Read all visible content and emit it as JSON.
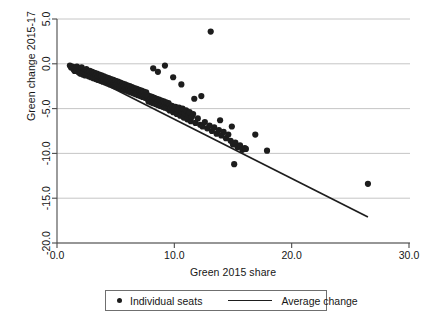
{
  "chart": {
    "type": "scatter",
    "title": "",
    "xlabel": "Green 2015 share",
    "ylabel": "Green change 2015-17",
    "xticks": [
      "0.0",
      "10.0",
      "20.0",
      "30.0"
    ],
    "yticks": [
      "5.0",
      "0.0",
      "-5.0",
      "-10.0",
      "-15.0",
      "-20.0"
    ],
    "legend": {
      "points_label": "Individual seats",
      "line_label": "Average change",
      "point_marker": "filled-circle-marker",
      "line_marker": "solid-line-marker"
    }
  },
  "chart_data": {
    "type": "scatter",
    "title": "",
    "xlabel": "Green 2015 share",
    "ylabel": "Green change 2015-17",
    "xlim": [
      0.0,
      30.0
    ],
    "ylim": [
      -20.0,
      5.0
    ],
    "xticks": [
      0.0,
      10.0,
      20.0,
      30.0
    ],
    "yticks": [
      5.0,
      0.0,
      -5.0,
      -10.0,
      -15.0,
      -20.0
    ],
    "grid": "horizontal",
    "legend_position": "below-axes",
    "series": [
      {
        "name": "Individual seats",
        "type": "scatter",
        "color": "#1d1d1d",
        "marker_size": 3.1,
        "points": [
          [
            1.1,
            -0.2
          ],
          [
            1.2,
            -0.4
          ],
          [
            1.3,
            -0.3
          ],
          [
            1.4,
            -0.6
          ],
          [
            1.5,
            -0.4
          ],
          [
            1.5,
            -0.8
          ],
          [
            1.6,
            -0.5
          ],
          [
            1.7,
            -0.7
          ],
          [
            1.7,
            -0.3
          ],
          [
            1.8,
            -0.9
          ],
          [
            1.8,
            -0.5
          ],
          [
            1.9,
            -0.6
          ],
          [
            1.9,
            -1.0
          ],
          [
            2.0,
            -0.7
          ],
          [
            2.0,
            -1.1
          ],
          [
            2.1,
            -0.8
          ],
          [
            2.1,
            -0.4
          ],
          [
            2.2,
            -0.9
          ],
          [
            2.2,
            -1.2
          ],
          [
            2.3,
            -0.7
          ],
          [
            2.3,
            -1.0
          ],
          [
            2.4,
            -1.3
          ],
          [
            2.4,
            -0.8
          ],
          [
            2.5,
            -1.1
          ],
          [
            2.5,
            -0.6
          ],
          [
            2.6,
            -1.2
          ],
          [
            2.6,
            -0.9
          ],
          [
            2.7,
            -1.4
          ],
          [
            2.7,
            -1.0
          ],
          [
            2.8,
            -1.2
          ],
          [
            2.8,
            -0.8
          ],
          [
            2.9,
            -1.5
          ],
          [
            2.9,
            -1.1
          ],
          [
            3.0,
            -1.3
          ],
          [
            3.0,
            -0.9
          ],
          [
            3.1,
            -1.6
          ],
          [
            3.1,
            -1.2
          ],
          [
            3.2,
            -1.4
          ],
          [
            3.2,
            -1.0
          ],
          [
            3.3,
            -1.7
          ],
          [
            3.3,
            -1.3
          ],
          [
            3.4,
            -1.5
          ],
          [
            3.4,
            -1.1
          ],
          [
            3.5,
            -1.8
          ],
          [
            3.5,
            -1.4
          ],
          [
            3.6,
            -1.6
          ],
          [
            3.6,
            -1.2
          ],
          [
            3.7,
            -1.9
          ],
          [
            3.7,
            -1.5
          ],
          [
            3.8,
            -1.7
          ],
          [
            3.8,
            -1.3
          ],
          [
            3.9,
            -2.0
          ],
          [
            3.9,
            -1.6
          ],
          [
            4.0,
            -1.8
          ],
          [
            4.0,
            -1.4
          ],
          [
            4.1,
            -2.1
          ],
          [
            4.1,
            -1.7
          ],
          [
            4.2,
            -1.9
          ],
          [
            4.2,
            -1.5
          ],
          [
            4.3,
            -2.2
          ],
          [
            4.3,
            -1.8
          ],
          [
            4.4,
            -2.0
          ],
          [
            4.4,
            -1.6
          ],
          [
            4.5,
            -2.3
          ],
          [
            4.5,
            -1.9
          ],
          [
            4.6,
            -2.1
          ],
          [
            4.6,
            -1.7
          ],
          [
            4.7,
            -2.4
          ],
          [
            4.7,
            -2.0
          ],
          [
            4.8,
            -2.2
          ],
          [
            4.8,
            -1.8
          ],
          [
            4.9,
            -2.5
          ],
          [
            4.9,
            -2.1
          ],
          [
            5.0,
            -2.3
          ],
          [
            5.0,
            -1.9
          ],
          [
            5.1,
            -2.6
          ],
          [
            5.1,
            -2.2
          ],
          [
            5.2,
            -2.4
          ],
          [
            5.2,
            -2.0
          ],
          [
            5.3,
            -2.7
          ],
          [
            5.3,
            -2.3
          ],
          [
            5.4,
            -2.5
          ],
          [
            5.4,
            -2.1
          ],
          [
            5.5,
            -2.8
          ],
          [
            5.5,
            -2.4
          ],
          [
            5.6,
            -2.6
          ],
          [
            5.6,
            -2.2
          ],
          [
            5.7,
            -2.9
          ],
          [
            5.7,
            -2.5
          ],
          [
            5.8,
            -2.7
          ],
          [
            5.8,
            -2.3
          ],
          [
            5.9,
            -3.0
          ],
          [
            5.9,
            -2.6
          ],
          [
            6.0,
            -2.8
          ],
          [
            6.0,
            -2.4
          ],
          [
            6.1,
            -3.1
          ],
          [
            6.1,
            -2.7
          ],
          [
            6.2,
            -2.9
          ],
          [
            6.2,
            -2.5
          ],
          [
            6.3,
            -3.2
          ],
          [
            6.3,
            -2.8
          ],
          [
            6.4,
            -3.0
          ],
          [
            6.4,
            -2.6
          ],
          [
            6.5,
            -3.3
          ],
          [
            6.5,
            -2.9
          ],
          [
            6.6,
            -3.1
          ],
          [
            6.6,
            -2.7
          ],
          [
            6.7,
            -3.4
          ],
          [
            6.7,
            -3.0
          ],
          [
            6.8,
            -3.2
          ],
          [
            6.8,
            -2.8
          ],
          [
            6.9,
            -3.5
          ],
          [
            6.9,
            -3.1
          ],
          [
            7.0,
            -3.3
          ],
          [
            7.0,
            -2.9
          ],
          [
            7.1,
            -3.6
          ],
          [
            7.1,
            -3.2
          ],
          [
            7.2,
            -3.4
          ],
          [
            7.2,
            -3.0
          ],
          [
            7.3,
            -3.7
          ],
          [
            7.3,
            -3.3
          ],
          [
            7.4,
            -3.5
          ],
          [
            7.4,
            -3.1
          ],
          [
            7.5,
            -3.8
          ],
          [
            7.5,
            -3.4
          ],
          [
            7.6,
            -3.6
          ],
          [
            7.6,
            -3.2
          ],
          [
            7.7,
            -3.9
          ],
          [
            7.7,
            -3.5
          ],
          [
            7.8,
            -3.7
          ],
          [
            7.8,
            -4.2
          ],
          [
            7.9,
            -4.0
          ],
          [
            7.9,
            -3.6
          ],
          [
            8.0,
            -3.8
          ],
          [
            8.0,
            -4.3
          ],
          [
            8.1,
            -4.1
          ],
          [
            8.1,
            -3.7
          ],
          [
            8.2,
            -3.9
          ],
          [
            8.2,
            -4.4
          ],
          [
            8.3,
            -4.2
          ],
          [
            8.3,
            -3.8
          ],
          [
            8.4,
            -4.0
          ],
          [
            8.4,
            -4.5
          ],
          [
            8.5,
            -4.3
          ],
          [
            8.5,
            -3.9
          ],
          [
            8.6,
            -4.1
          ],
          [
            8.6,
            -4.6
          ],
          [
            8.7,
            -4.4
          ],
          [
            8.7,
            -4.0
          ],
          [
            8.8,
            -4.2
          ],
          [
            8.8,
            -4.7
          ],
          [
            8.9,
            -4.5
          ],
          [
            8.9,
            -4.1
          ],
          [
            9.0,
            -4.3
          ],
          [
            9.0,
            -4.8
          ],
          [
            9.1,
            -4.6
          ],
          [
            9.1,
            -4.2
          ],
          [
            9.2,
            -4.4
          ],
          [
            9.2,
            -4.9
          ],
          [
            9.3,
            -4.7
          ],
          [
            9.3,
            -4.3
          ],
          [
            9.4,
            -4.5
          ],
          [
            9.4,
            -5.0
          ],
          [
            9.5,
            -4.8
          ],
          [
            9.5,
            -4.4
          ],
          [
            9.6,
            -4.6
          ],
          [
            9.6,
            -5.2
          ],
          [
            9.7,
            -4.9
          ],
          [
            9.8,
            -4.7
          ],
          [
            9.9,
            -5.4
          ],
          [
            10.0,
            -5.0
          ],
          [
            10.1,
            -4.8
          ],
          [
            10.2,
            -5.6
          ],
          [
            10.3,
            -5.1
          ],
          [
            10.4,
            -4.9
          ],
          [
            10.5,
            -5.8
          ],
          [
            10.6,
            -5.3
          ],
          [
            10.7,
            -5.0
          ],
          [
            10.8,
            -6.0
          ],
          [
            10.9,
            -5.5
          ],
          [
            11.0,
            -5.2
          ],
          [
            11.1,
            -6.2
          ],
          [
            11.2,
            -5.7
          ],
          [
            11.3,
            -5.4
          ],
          [
            11.4,
            -6.4
          ],
          [
            11.5,
            -5.9
          ],
          [
            11.6,
            -5.6
          ],
          [
            11.8,
            -6.6
          ],
          [
            12.0,
            -6.1
          ],
          [
            12.2,
            -6.8
          ],
          [
            12.4,
            -7.0
          ],
          [
            12.6,
            -6.5
          ],
          [
            12.8,
            -7.2
          ],
          [
            13.0,
            -6.9
          ],
          [
            13.2,
            -7.5
          ],
          [
            13.4,
            -7.1
          ],
          [
            13.6,
            -7.8
          ],
          [
            13.8,
            -7.4
          ],
          [
            14.0,
            -8.0
          ],
          [
            14.2,
            -7.6
          ],
          [
            14.4,
            -8.3
          ],
          [
            14.6,
            -7.9
          ],
          [
            14.8,
            -8.6
          ],
          [
            15.0,
            -9.0
          ],
          [
            15.2,
            -8.8
          ],
          [
            15.4,
            -9.3
          ],
          [
            15.6,
            -9.1
          ],
          [
            15.8,
            -9.6
          ],
          [
            16.0,
            -9.4
          ],
          [
            9.9,
            -1.5
          ],
          [
            10.6,
            -2.3
          ],
          [
            8.6,
            -0.9
          ],
          [
            9.2,
            -0.2
          ],
          [
            8.2,
            -0.5
          ],
          [
            11.7,
            -3.9
          ],
          [
            12.3,
            -3.6
          ],
          [
            13.1,
            3.6
          ],
          [
            13.9,
            -6.3
          ],
          [
            14.9,
            -7.0
          ],
          [
            16.1,
            -9.5
          ],
          [
            15.1,
            -11.2
          ],
          [
            16.9,
            -7.9
          ],
          [
            17.9,
            -9.7
          ],
          [
            26.5,
            -13.4
          ]
        ]
      },
      {
        "name": "Average change",
        "type": "line",
        "color": "#1d1d1d",
        "fit": "linear",
        "endpoints": [
          [
            1.1,
            -0.3
          ],
          [
            26.5,
            -17.1
          ]
        ],
        "slope": -0.661,
        "intercept": 0.43
      }
    ]
  }
}
